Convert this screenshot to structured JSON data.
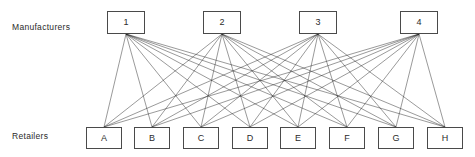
{
  "diagram": {
    "rows": {
      "manufacturers_label": "Manufacturers",
      "retailers_label": "Retailers"
    },
    "style": {
      "background": "#ffffff",
      "box_stroke": "#4a4a4a",
      "edge_stroke": "#1d1d1d",
      "text_color": "#2b2b2b"
    },
    "manufacturers": [
      {
        "id": "M1",
        "label": "1",
        "x": 107,
        "y": 11,
        "w": 38,
        "h": 23
      },
      {
        "id": "M2",
        "label": "2",
        "x": 203,
        "y": 11,
        "w": 38,
        "h": 23
      },
      {
        "id": "M3",
        "label": "3",
        "x": 299,
        "y": 11,
        "w": 38,
        "h": 23
      },
      {
        "id": "M4",
        "label": "4",
        "x": 400,
        "y": 11,
        "w": 38,
        "h": 23
      }
    ],
    "retailers": [
      {
        "id": "A",
        "label": "A",
        "x": 86,
        "y": 127,
        "w": 36,
        "h": 22
      },
      {
        "id": "B",
        "label": "B",
        "x": 134,
        "y": 127,
        "w": 36,
        "h": 22
      },
      {
        "id": "C",
        "label": "C",
        "x": 183,
        "y": 127,
        "w": 36,
        "h": 22
      },
      {
        "id": "D",
        "label": "D",
        "x": 232,
        "y": 127,
        "w": 36,
        "h": 22
      },
      {
        "id": "E",
        "label": "E",
        "x": 280,
        "y": 127,
        "w": 36,
        "h": 22
      },
      {
        "id": "F",
        "label": "F",
        "x": 329,
        "y": 127,
        "w": 36,
        "h": 22
      },
      {
        "id": "G",
        "label": "G",
        "x": 378,
        "y": 127,
        "w": 36,
        "h": 22
      },
      {
        "id": "H",
        "label": "H",
        "x": 427,
        "y": 127,
        "w": 36,
        "h": 22
      }
    ],
    "edges": {
      "type": "complete-bipartite",
      "count": 32,
      "from": [
        "M1",
        "M2",
        "M3",
        "M4"
      ],
      "to": [
        "A",
        "B",
        "C",
        "D",
        "E",
        "F",
        "G",
        "H"
      ]
    }
  }
}
